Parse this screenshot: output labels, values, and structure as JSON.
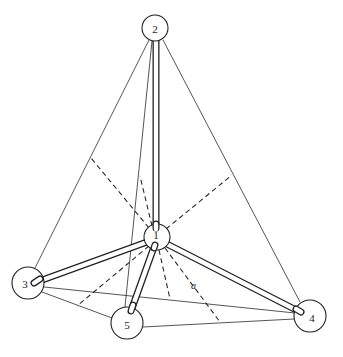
{
  "diagram": {
    "type": "tetrahedral molecule (central atom 1 with four ligands)",
    "atoms": [
      {
        "id": "1",
        "label": "1",
        "x": 157,
        "y": 237,
        "r": 13
      },
      {
        "id": "2",
        "label": "2",
        "x": 155,
        "y": 28,
        "r": 13
      },
      {
        "id": "3",
        "label": "3",
        "x": 28,
        "y": 283,
        "r": 16
      },
      {
        "id": "4",
        "label": "4",
        "x": 310,
        "y": 316,
        "r": 16
      },
      {
        "id": "5",
        "label": "5",
        "x": 127,
        "y": 323,
        "r": 16
      }
    ],
    "bonds": [
      {
        "from": "1",
        "to": "2"
      },
      {
        "from": "1",
        "to": "3"
      },
      {
        "from": "1",
        "to": "4"
      },
      {
        "from": "1",
        "to": "5"
      }
    ],
    "tetrahedron_edges": [
      {
        "from": "2",
        "to": "3"
      },
      {
        "from": "2",
        "to": "4"
      },
      {
        "from": "2",
        "to": "5"
      },
      {
        "from": "3",
        "to": "4"
      },
      {
        "from": "3",
        "to": "5"
      },
      {
        "from": "5",
        "to": "4"
      }
    ],
    "dashed_perpendiculars": [
      {
        "from": "1",
        "to_edge": "2-3"
      },
      {
        "from": "1",
        "to_edge": "2-5"
      },
      {
        "from": "1",
        "to_edge": "2-4"
      },
      {
        "from": "1",
        "to_edge": "3-5"
      },
      {
        "from": "1",
        "to_edge": "3-4"
      },
      {
        "from": "1",
        "to_edge": "5-4"
      }
    ],
    "annotation": {
      "label": "a",
      "x": 191,
      "y": 289
    }
  }
}
